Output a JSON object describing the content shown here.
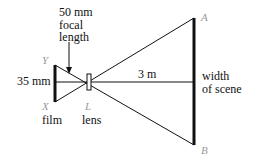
{
  "diagram": {
    "labels": {
      "focal_line1": "50 mm",
      "focal_line2": "focal",
      "focal_line3": "length",
      "film_height": "35 mm",
      "film": "film",
      "lens": "lens",
      "distance": "3 m",
      "scene_line1": "width",
      "scene_line2": "of scene"
    },
    "points": {
      "Y": "Y",
      "X": "X",
      "L": "L",
      "A": "A",
      "B": "B"
    },
    "colors": {
      "lines": "#111111",
      "point_labels": "#9a9a9a"
    }
  }
}
